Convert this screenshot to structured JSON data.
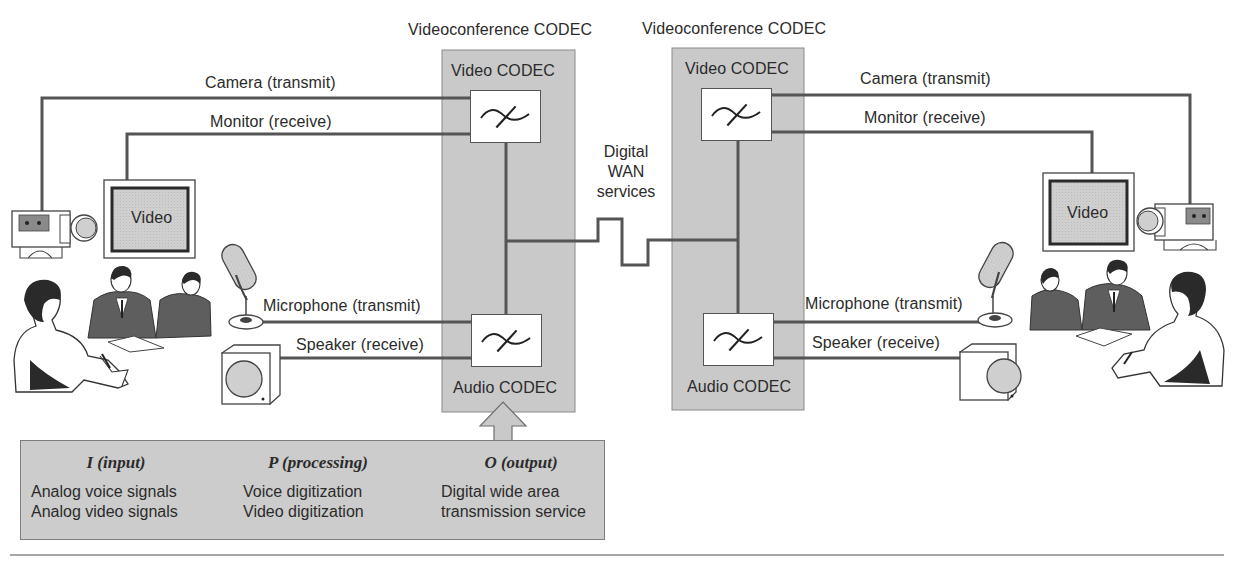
{
  "figure": {
    "title_left": "Videoconference CODEC",
    "title_right": "Videoconference CODEC",
    "wan_label": [
      "Digital",
      "WAN",
      "services"
    ],
    "colors": {
      "panel_fill": "#c9c9c9",
      "wire": "#555555",
      "ipo_fill": "#cccccc",
      "screen_fill": "#cfcfcf",
      "suit": "#5e5e5e"
    }
  },
  "left_site": {
    "codec": {
      "video_codec_label": "Video CODEC",
      "audio_codec_label": "Audio CODEC"
    },
    "connections": {
      "camera": "Camera (transmit)",
      "monitor": "Monitor (receive)",
      "microphone": "Microphone (transmit)",
      "speaker": "Speaker (receive)"
    },
    "monitor_screen_text": "Video"
  },
  "right_site": {
    "codec": {
      "video_codec_label": "Video CODEC",
      "audio_codec_label": "Audio CODEC"
    },
    "connections": {
      "camera": "Camera (transmit)",
      "monitor": "Monitor (receive)",
      "microphone": "Microphone (transmit)",
      "speaker": "Speaker (receive)"
    },
    "monitor_screen_text": "Video"
  },
  "ipo": {
    "columns": [
      {
        "heading": "I (input)",
        "lines": [
          "Analog voice signals",
          "Analog video signals"
        ]
      },
      {
        "heading": "P (processing)",
        "lines": [
          "Voice digitization",
          "Video digitization"
        ]
      },
      {
        "heading": "O (output)",
        "lines": [
          "Digital wide area",
          "transmission service"
        ]
      }
    ]
  }
}
